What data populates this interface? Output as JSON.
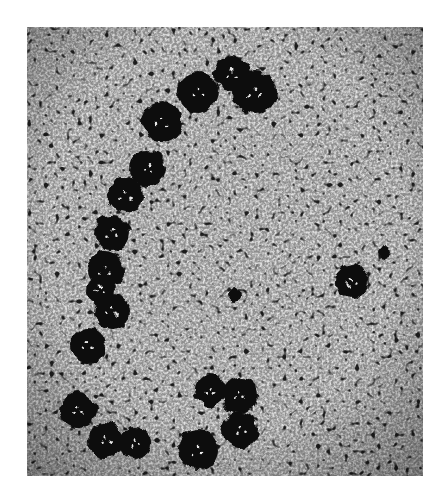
{
  "image": {
    "kind": "grayscale phase-contrast micrograph",
    "background_color": "#ffffff",
    "frame": {
      "x": 27,
      "y": 27,
      "width": 396,
      "height": 449
    },
    "field_color": "#9a9a9a",
    "blob_color": "#0a0a0a",
    "blobs": [
      {
        "cx": 135,
        "cy": 95,
        "r": 20
      },
      {
        "cx": 171,
        "cy": 65,
        "r": 20
      },
      {
        "cx": 205,
        "cy": 47,
        "r": 18
      },
      {
        "cx": 228,
        "cy": 65,
        "r": 22
      },
      {
        "cx": 121,
        "cy": 141,
        "r": 18
      },
      {
        "cx": 98,
        "cy": 168,
        "r": 18
      },
      {
        "cx": 85,
        "cy": 206,
        "r": 18
      },
      {
        "cx": 78,
        "cy": 243,
        "r": 18
      },
      {
        "cx": 73,
        "cy": 263,
        "r": 14
      },
      {
        "cx": 85,
        "cy": 285,
        "r": 18
      },
      {
        "cx": 61,
        "cy": 318,
        "r": 18
      },
      {
        "cx": 51,
        "cy": 383,
        "r": 18
      },
      {
        "cx": 78,
        "cy": 413,
        "r": 18
      },
      {
        "cx": 108,
        "cy": 416,
        "r": 16
      },
      {
        "cx": 183,
        "cy": 363,
        "r": 16
      },
      {
        "cx": 213,
        "cy": 368,
        "r": 18
      },
      {
        "cx": 213,
        "cy": 403,
        "r": 18
      },
      {
        "cx": 171,
        "cy": 423,
        "r": 20
      },
      {
        "cx": 325,
        "cy": 255,
        "r": 17
      },
      {
        "cx": 358,
        "cy": 226,
        "r": 7
      },
      {
        "cx": 208,
        "cy": 268,
        "r": 6
      }
    ]
  }
}
